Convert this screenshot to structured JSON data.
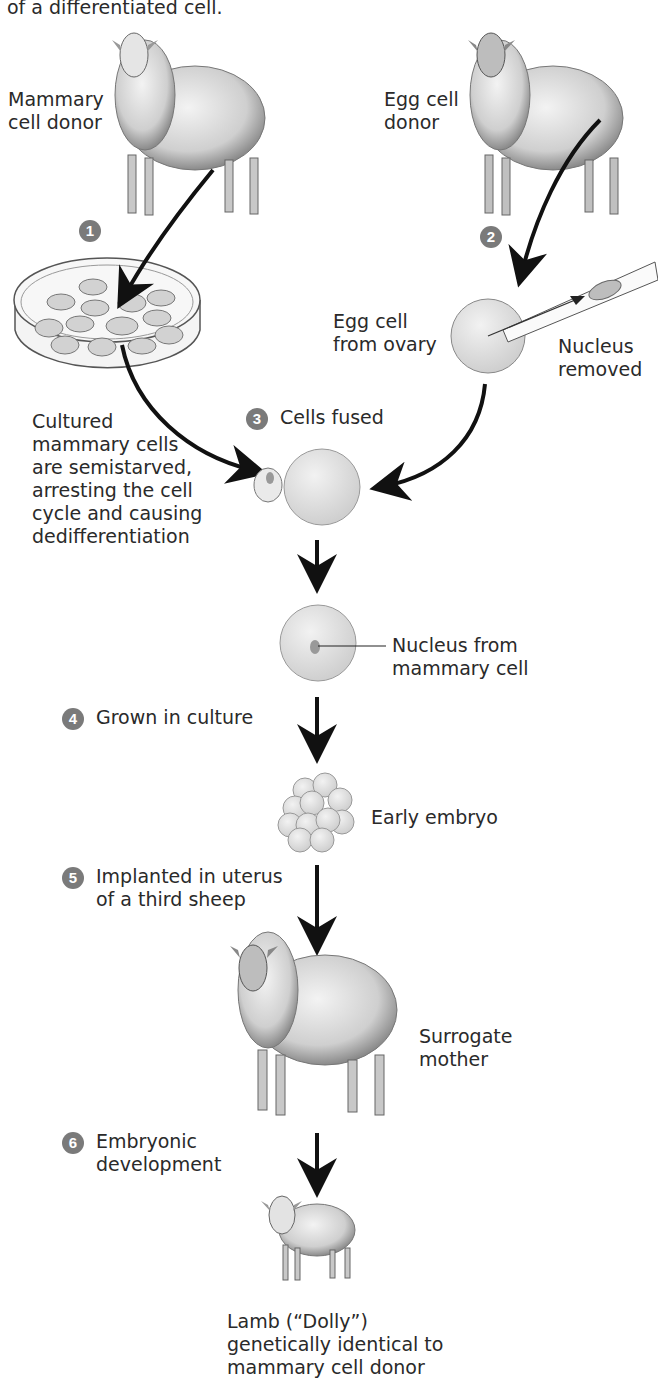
{
  "title_fragment": "of a differentiated cell.",
  "labels": {
    "mammary_donor": [
      "Mammary",
      "cell donor"
    ],
    "egg_donor": [
      "Egg cell",
      "donor"
    ],
    "egg_from_ovary": [
      "Egg cell",
      "from ovary"
    ],
    "nucleus_removed": [
      "Nucleus",
      "removed"
    ],
    "cultured": [
      "Cultured",
      "mammary cells",
      "are semistarved,",
      "arresting the cell",
      "cycle and causing",
      "dedifferentiation"
    ],
    "nucleus_from": [
      "Nucleus from",
      "mammary cell"
    ],
    "early_embryo": "Early embryo",
    "surrogate": [
      "Surrogate",
      "mother"
    ],
    "lamb": [
      "Lamb (“Dolly”)",
      "genetically identical to",
      "mammary cell donor"
    ]
  },
  "steps": [
    {
      "num": "1",
      "label": ""
    },
    {
      "num": "2",
      "label": ""
    },
    {
      "num": "3",
      "label": "Cells fused"
    },
    {
      "num": "4",
      "label": "Grown in culture"
    },
    {
      "num": "5",
      "label": [
        "Implanted in uterus",
        "of a third sheep"
      ]
    },
    {
      "num": "6",
      "label": [
        "Embryonic",
        "development"
      ]
    }
  ],
  "colors": {
    "badge": "#7a7a7a",
    "cell_fill": "#dcdcdc",
    "arrow": "#111111"
  }
}
